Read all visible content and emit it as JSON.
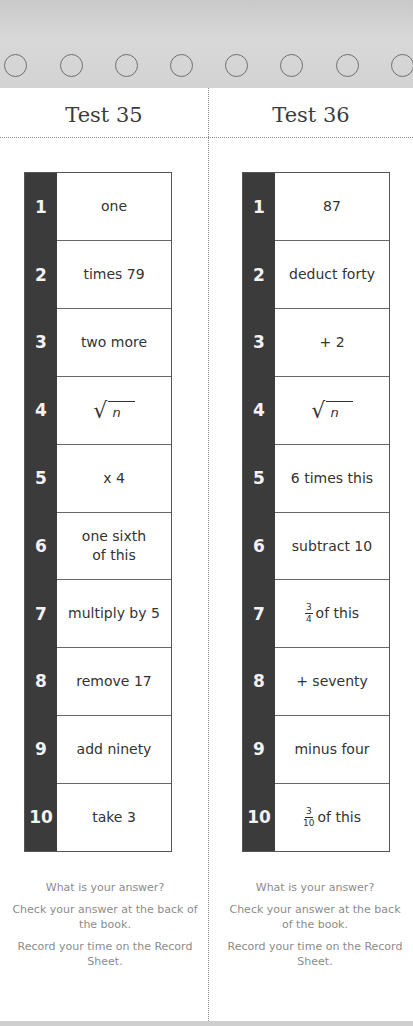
{
  "tests": [
    {
      "title": "Test 35",
      "steps": [
        {
          "n": "1",
          "text": "one"
        },
        {
          "n": "2",
          "text": "times 79"
        },
        {
          "n": "3",
          "text": "two more"
        },
        {
          "n": "4",
          "text": "√n",
          "kind": "sqrt",
          "radicand": "n"
        },
        {
          "n": "5",
          "text": "x 4"
        },
        {
          "n": "6",
          "text": "one sixth of this",
          "line1": "one sixth",
          "line2": "of this"
        },
        {
          "n": "7",
          "text": "multiply by 5"
        },
        {
          "n": "8",
          "text": "remove 17"
        },
        {
          "n": "9",
          "text": "add ninety"
        },
        {
          "n": "10",
          "text": "take 3"
        }
      ],
      "footer": {
        "question": "What is your answer?",
        "check": "Check your answer at the back of the book.",
        "record": "Record your time on the Record Sheet."
      }
    },
    {
      "title": "Test 36",
      "steps": [
        {
          "n": "1",
          "text": "87"
        },
        {
          "n": "2",
          "text": "deduct forty"
        },
        {
          "n": "3",
          "text": "+ 2"
        },
        {
          "n": "4",
          "text": "√n",
          "kind": "sqrt",
          "radicand": "n"
        },
        {
          "n": "5",
          "text": "6 times this"
        },
        {
          "n": "6",
          "text": "subtract 10"
        },
        {
          "n": "7",
          "text": "3/4 of this",
          "kind": "frac",
          "num": "3",
          "den": "4",
          "rest": "of this"
        },
        {
          "n": "8",
          "text": "+ seventy"
        },
        {
          "n": "9",
          "text": "minus four"
        },
        {
          "n": "10",
          "text": "3/10 of this",
          "kind": "frac",
          "num": "3",
          "den": "10",
          "rest": "of this"
        }
      ],
      "footer": {
        "question": "What is your answer?",
        "check": "Check your answer at the back of the book.",
        "record": "Record your time on the Record Sheet."
      }
    }
  ],
  "colors": {
    "number_column": "#3b3b3b",
    "band": "#d3d3d3",
    "footer_text": "#8c8c8c"
  },
  "holes_count": 8
}
